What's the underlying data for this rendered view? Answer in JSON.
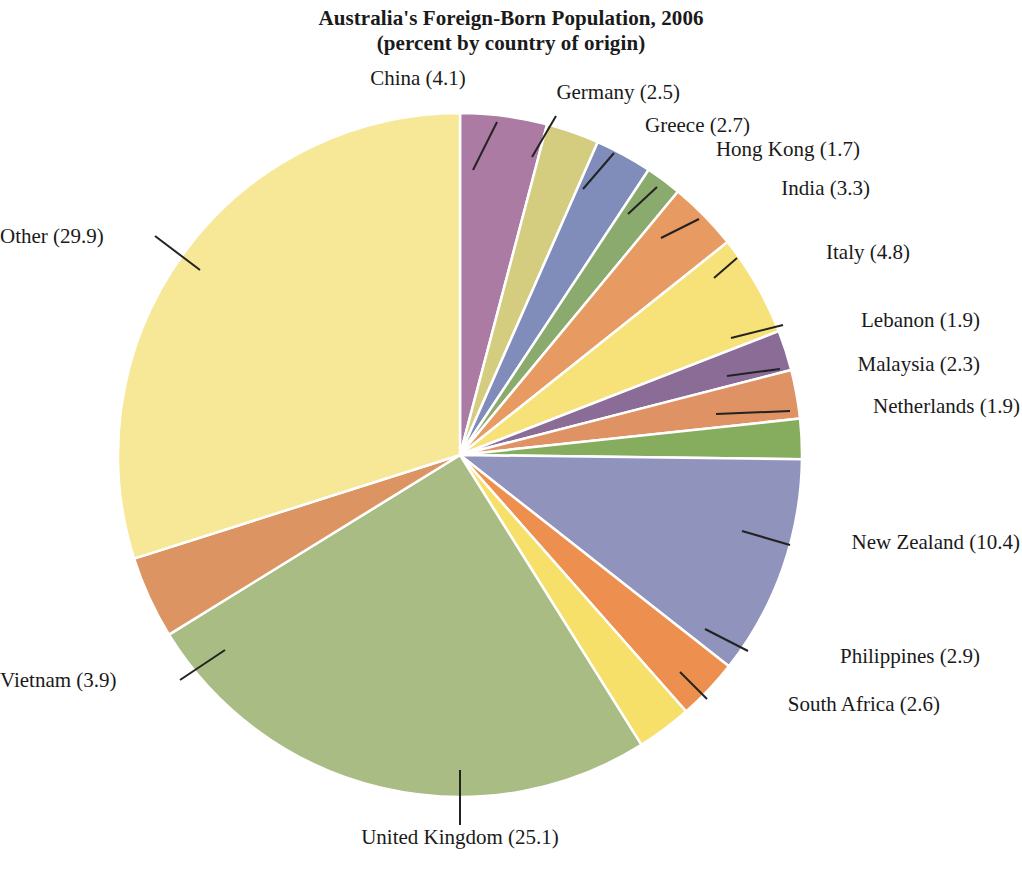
{
  "chart_data": {
    "type": "pie",
    "title": "Australia's Foreign-Born Population, 2006",
    "subtitle": "(percent by country of origin)",
    "unit": "percent",
    "total": 100.0,
    "start_angle_deg": 0,
    "direction": "clockwise",
    "legend": "none (direct labels with leader lines)",
    "categories": [
      "China",
      "Germany",
      "Greece",
      "Hong Kong",
      "India",
      "Italy",
      "Lebanon",
      "Malaysia",
      "Netherlands",
      "New Zealand",
      "Philippines",
      "South Africa",
      "United Kingdom",
      "Vietnam",
      "Other"
    ],
    "values": [
      4.1,
      2.5,
      2.7,
      1.7,
      3.3,
      4.8,
      1.9,
      2.3,
      1.9,
      10.4,
      2.9,
      2.6,
      25.1,
      3.9,
      29.9
    ],
    "colors": [
      "#ab7ba3",
      "#d4cd80",
      "#808dba",
      "#8aab6d",
      "#e79a62",
      "#f6e279",
      "#8b6c96",
      "#df9263",
      "#86ad5e",
      "#9093bc",
      "#ed8f4e",
      "#f7e06a",
      "#a8bc84",
      "#dd9463",
      "#f7e898"
    ],
    "slices": [
      {
        "name": "China",
        "value": 4.1,
        "label": "China (4.1)",
        "color": "#ab7ba3"
      },
      {
        "name": "Germany",
        "value": 2.5,
        "label": "Germany (2.5)",
        "color": "#d4cd80"
      },
      {
        "name": "Greece",
        "value": 2.7,
        "label": "Greece (2.7)",
        "color": "#808dba"
      },
      {
        "name": "Hong Kong",
        "value": 1.7,
        "label": "Hong Kong (1.7)",
        "color": "#8aab6d"
      },
      {
        "name": "India",
        "value": 3.3,
        "label": "India (3.3)",
        "color": "#e79a62"
      },
      {
        "name": "Italy",
        "value": 4.8,
        "label": "Italy (4.8)",
        "color": "#f6e279"
      },
      {
        "name": "Lebanon",
        "value": 1.9,
        "label": "Lebanon (1.9)",
        "color": "#8b6c96"
      },
      {
        "name": "Malaysia",
        "value": 2.3,
        "label": "Malaysia (2.3)",
        "color": "#df9263"
      },
      {
        "name": "Netherlands",
        "value": 1.9,
        "label": "Netherlands (1.9)",
        "color": "#86ad5e"
      },
      {
        "name": "New Zealand",
        "value": 10.4,
        "label": "New Zealand (10.4)",
        "color": "#9093bc"
      },
      {
        "name": "Philippines",
        "value": 2.9,
        "label": "Philippines (2.9)",
        "color": "#ed8f4e"
      },
      {
        "name": "South Africa",
        "value": 2.6,
        "label": "South Africa (2.6)",
        "color": "#f7e06a"
      },
      {
        "name": "United Kingdom",
        "value": 25.1,
        "label": "United Kingdom (25.1)",
        "color": "#a8bc84"
      },
      {
        "name": "Vietnam",
        "value": 3.9,
        "label": "Vietnam (3.9)",
        "color": "#dd9463"
      },
      {
        "name": "Other",
        "value": 29.9,
        "label": "Other (29.9)",
        "color": "#f7e898"
      }
    ]
  },
  "labels": {
    "china": "China (4.1)",
    "germany": "Germany (2.5)",
    "greece": "Greece (2.7)",
    "hong_kong": "Hong Kong (1.7)",
    "india": "India (3.3)",
    "italy": "Italy (4.8)",
    "lebanon": "Lebanon (1.9)",
    "malaysia": "Malaysia (2.3)",
    "netherlands": "Netherlands (1.9)",
    "new_zealand": "New Zealand (10.4)",
    "philippines": "Philippines (2.9)",
    "south_africa": "South Africa (2.6)",
    "united_kingdom": "United Kingdom (25.1)",
    "vietnam": "Vietnam (3.9)",
    "other": "Other (29.9)"
  },
  "title": {
    "line1": "Australia's Foreign-Born Population, 2006",
    "line2": "(percent by country of origin)"
  },
  "geometry": {
    "center_x": 460,
    "center_y": 455,
    "radius": 342,
    "separator_color": "#ffffff",
    "leader_color": "#222222"
  }
}
